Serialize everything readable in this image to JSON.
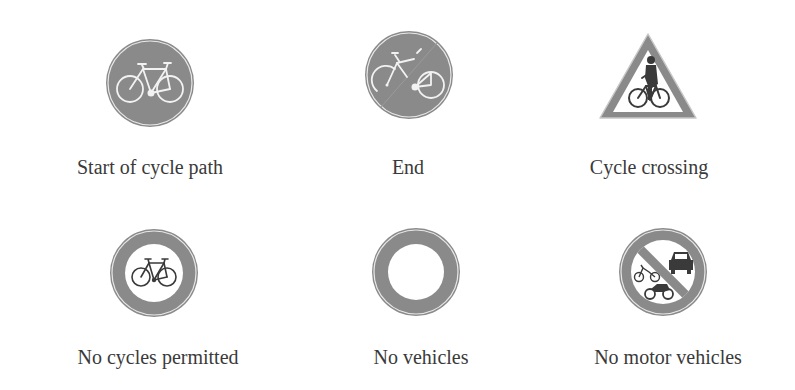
{
  "colors": {
    "sign_gray": "#8a8a8a",
    "sign_border": "#ffffff",
    "text": "#3a3a3a",
    "background": "#ffffff"
  },
  "signs": [
    {
      "id": "start-cycle-path",
      "label": "Start of cycle path",
      "shape": "circle-filled",
      "icon": "bicycle-icon"
    },
    {
      "id": "end-cycle-path",
      "label": "End",
      "shape": "circle-filled-with-slash",
      "icon": "bicycle-icon"
    },
    {
      "id": "cycle-crossing",
      "label": "Cycle crossing",
      "shape": "triangle-warning",
      "icon": "cyclist-icon"
    },
    {
      "id": "no-cycles",
      "label": "No cycles permitted",
      "shape": "circle-ring",
      "icon": "bicycle-icon"
    },
    {
      "id": "no-vehicles",
      "label": "No vehicles",
      "shape": "circle-ring",
      "icon": "none"
    },
    {
      "id": "no-motor-vehicles",
      "label": "No motor vehicles",
      "shape": "circle-ring-with-slash",
      "icon": "car-and-motorcycle-icon"
    }
  ]
}
